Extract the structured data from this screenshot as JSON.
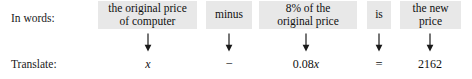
{
  "figure": {
    "type": "word-problem-translation",
    "row_labels": {
      "words": "In words:",
      "translate": "Translate:"
    },
    "shade_color": "#e8e8e8",
    "text_color": "#111111",
    "background": "#ffffff",
    "arrow_glyph": "down-arrow",
    "columns": [
      {
        "phrase_lines": [
          "the original price",
          "of computer"
        ],
        "translation": "x",
        "translation_style": "italic-variable",
        "arrow": "↓"
      },
      {
        "phrase_lines": [
          "minus"
        ],
        "translation": "−",
        "translation_style": "operator",
        "arrow": "↓"
      },
      {
        "phrase_lines": [
          "8% of the",
          "original price"
        ],
        "translation_prefix": "0.08",
        "translation_variable": "x",
        "translation": "0.08x",
        "translation_style": "coefficient-variable",
        "arrow": "↓"
      },
      {
        "phrase_lines": [
          "is"
        ],
        "translation": "=",
        "translation_style": "operator",
        "arrow": "↓"
      },
      {
        "phrase_lines": [
          "the new",
          "price"
        ],
        "translation": "2162",
        "translation_style": "number",
        "arrow": "↓"
      }
    ],
    "equation": "x − 0.08x = 2162"
  }
}
